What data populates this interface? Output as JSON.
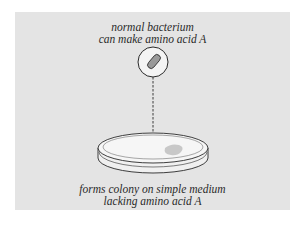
{
  "diagram": {
    "top_label": {
      "line1": "normal bacterium",
      "line2": "can make amino acid A"
    },
    "bottom_label": {
      "line1": "forms colony on simple medium",
      "line2": "lacking amino acid A"
    },
    "elements": {
      "bacterium": "rod-shaped bacterium in circle",
      "arrow": "dashed arrow pointing down",
      "dish": "petri dish with colony"
    },
    "colors": {
      "panel_background": "#e4e4e4",
      "bacterium_fill": "#9a9a9a",
      "colony_fill": "#c8c8c8",
      "line": "#2a2a2a"
    }
  }
}
